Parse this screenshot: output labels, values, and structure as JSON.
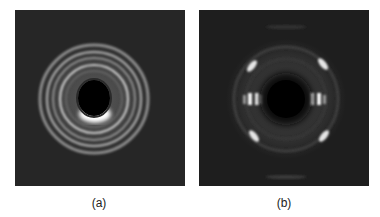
{
  "figure": {
    "panels": [
      {
        "id": "a",
        "label": "(a)",
        "description": "Diffraction pattern with concentric isotropic rings around central beam stop",
        "background_color": "#262626",
        "ring_color": "#bdbdbd"
      },
      {
        "id": "b",
        "label": "(b)",
        "description": "Oriented diffraction pattern with equatorial spots and four off-axis arcs around central beam stop",
        "background_color": "#1e1e1e",
        "spot_color": "#f0f0f0"
      }
    ]
  }
}
